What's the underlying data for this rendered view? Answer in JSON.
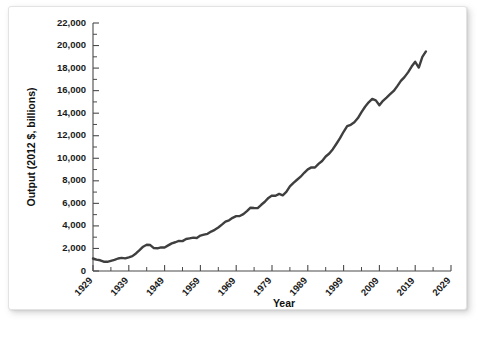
{
  "figure": {
    "background_color": "#ffffff",
    "card_border_color": "#e3e3e3"
  },
  "chart_data": {
    "type": "line",
    "title": "",
    "subtitle": "",
    "xlabel": "Year",
    "ylabel": "Output (2012 $, billions)",
    "xlim": [
      1929,
      2029
    ],
    "ylim": [
      0,
      22000
    ],
    "grid": false,
    "legend_position": "none",
    "line_color": "#3f3f3f",
    "x_tick_labels": [
      "1929",
      "1939",
      "1949",
      "1959",
      "1969",
      "1979",
      "1989",
      "1999",
      "2009",
      "2019",
      "2029"
    ],
    "x_tick_values": [
      1929,
      1939,
      1949,
      1959,
      1969,
      1979,
      1989,
      1999,
      2009,
      2019,
      2029
    ],
    "x_minor_tick_values": [
      1934,
      1944,
      1954,
      1964,
      1974,
      1984,
      1994,
      2004,
      2014,
      2024
    ],
    "y_tick_labels": [
      "0",
      "2,000",
      "4,000",
      "6,000",
      "8,000",
      "10,000",
      "12,000",
      "14,000",
      "16,000",
      "18,000",
      "20,000",
      "22,000"
    ],
    "y_tick_values": [
      0,
      2000,
      4000,
      6000,
      8000,
      10000,
      12000,
      14000,
      16000,
      18000,
      20000,
      22000
    ],
    "y_minor_tick_values": [
      1000,
      3000,
      5000,
      7000,
      9000,
      11000,
      13000,
      15000,
      17000,
      19000,
      21000
    ],
    "series": [
      {
        "name": "Real GDP",
        "x": [
          1929,
          1930,
          1931,
          1932,
          1933,
          1934,
          1935,
          1936,
          1937,
          1938,
          1939,
          1940,
          1941,
          1942,
          1943,
          1944,
          1945,
          1946,
          1947,
          1948,
          1949,
          1950,
          1951,
          1952,
          1953,
          1954,
          1955,
          1956,
          1957,
          1958,
          1959,
          1960,
          1961,
          1962,
          1963,
          1964,
          1965,
          1966,
          1967,
          1968,
          1969,
          1970,
          1971,
          1972,
          1973,
          1974,
          1975,
          1976,
          1977,
          1978,
          1979,
          1980,
          1981,
          1982,
          1983,
          1984,
          1985,
          1986,
          1987,
          1988,
          1989,
          1990,
          1991,
          1992,
          1993,
          1994,
          1995,
          1996,
          1997,
          1998,
          1999,
          2000,
          2001,
          2002,
          2003,
          2004,
          2005,
          2006,
          2007,
          2008,
          2009,
          2010,
          2011,
          2012,
          2013,
          2014,
          2015,
          2016,
          2017,
          2018,
          2019,
          2020,
          2021,
          2022
        ],
        "values": [
          1110,
          1015,
          950,
          825,
          815,
          900,
          980,
          1110,
          1165,
          1125,
          1215,
          1320,
          1555,
          1845,
          2155,
          2325,
          2300,
          2035,
          2015,
          2100,
          2090,
          2275,
          2455,
          2550,
          2670,
          2650,
          2840,
          2900,
          2960,
          2930,
          3140,
          3220,
          3300,
          3500,
          3650,
          3860,
          4110,
          4380,
          4500,
          4720,
          4870,
          4880,
          5040,
          5310,
          5615,
          5585,
          5575,
          5875,
          6145,
          6485,
          6690,
          6670,
          6840,
          6710,
          7010,
          7510,
          7820,
          8095,
          8365,
          8710,
          9020,
          9190,
          9180,
          9500,
          9760,
          10160,
          10420,
          10810,
          11290,
          11790,
          12350,
          12850,
          12970,
          13190,
          13570,
          14100,
          14570,
          14960,
          15260,
          15140,
          14700,
          15100,
          15380,
          15680,
          15970,
          16400,
          16860,
          17200,
          17620,
          18140,
          18560,
          18050,
          19000,
          19480
        ]
      }
    ]
  },
  "axes": {
    "y_axis_title": "Output (2012 $, billions)",
    "x_axis_title": "Year"
  }
}
